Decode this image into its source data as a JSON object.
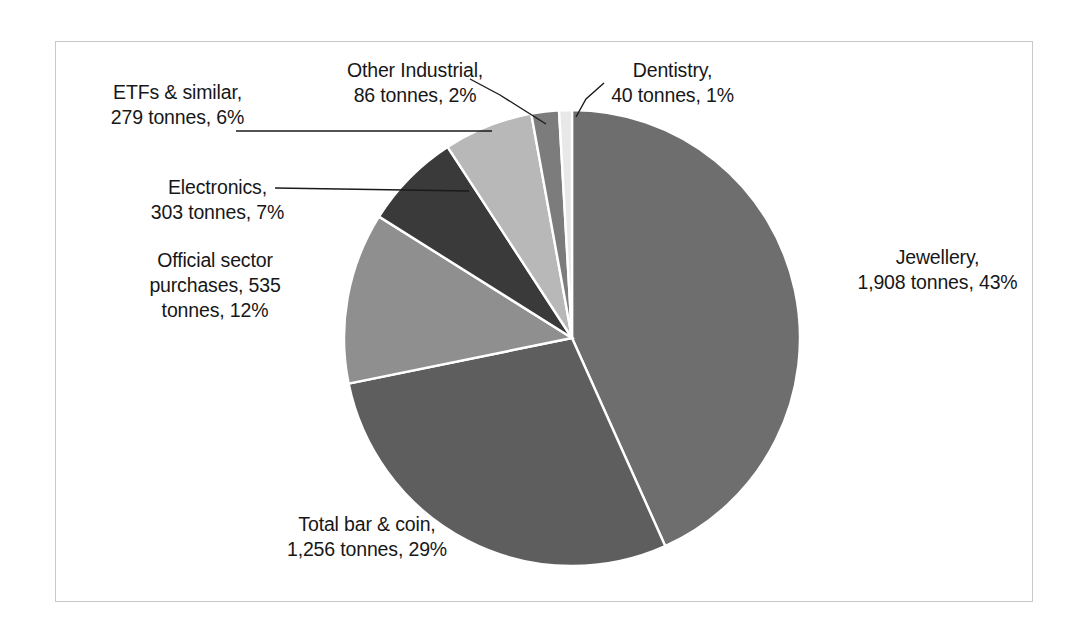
{
  "chart_data": {
    "type": "pie",
    "title": "",
    "unit": "tonnes",
    "legend_position": "none",
    "grid": false,
    "start_angle_deg": 0,
    "direction": "clockwise",
    "categories": [
      "Jewellery",
      "Total bar & coin",
      "Official sector purchases",
      "Electronics",
      "ETFs & similar",
      "Other Industrial",
      "Dentistry"
    ],
    "values": [
      1908,
      1256,
      535,
      303,
      279,
      86,
      40
    ],
    "percentages": [
      43,
      29,
      12,
      7,
      6,
      2,
      1
    ],
    "colors": [
      "#6e6e6e",
      "#5e5e5e",
      "#8f8f8f",
      "#3a3a3a",
      "#b8b8b8",
      "#7c7c7c",
      "#e8e8e8"
    ],
    "slices": [
      {
        "name": "Jewellery",
        "value": 1908,
        "percent": 43,
        "color": "#6e6e6e"
      },
      {
        "name": "Total bar & coin",
        "value": 1256,
        "percent": 29,
        "color": "#5e5e5e"
      },
      {
        "name": "Official sector purchases",
        "value": 535,
        "percent": 12,
        "color": "#8f8f8f"
      },
      {
        "name": "Electronics",
        "value": 303,
        "percent": 7,
        "color": "#3a3a3a"
      },
      {
        "name": "ETFs & similar",
        "value": 279,
        "percent": 6,
        "color": "#b8b8b8"
      },
      {
        "name": "Other Industrial",
        "value": 86,
        "percent": 2,
        "color": "#7c7c7c"
      },
      {
        "name": "Dentistry",
        "value": 40,
        "percent": 1,
        "color": "#e8e8e8"
      }
    ]
  },
  "labels": {
    "jewellery": "Jewellery,\n1,908 tonnes, 43%",
    "bar_and_coin": "Total bar & coin,\n1,256 tonnes, 29%",
    "official_sector": "Official sector\npurchases,  535\ntonnes, 12%",
    "electronics": "Electronics,\n303 tonnes, 7%",
    "etfs": "ETFs & similar,\n279 tonnes, 6%",
    "other_industrial": "Other Industrial,\n86 tonnes, 2%",
    "dentistry": "Dentistry,\n40 tonnes, 1%"
  }
}
